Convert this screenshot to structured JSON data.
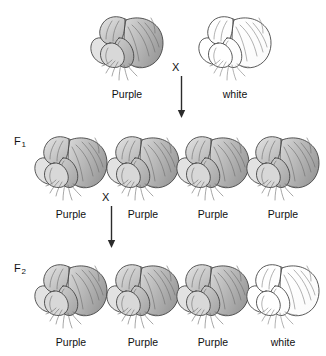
{
  "figure": {
    "background_color": "#ffffff",
    "line_color": "#3a3a3a"
  },
  "generations": [
    {
      "id": "parental",
      "label": "",
      "label_visible": false,
      "flowers": [
        {
          "phenotype_label": "Purple",
          "color_state": "purple",
          "x": 88,
          "y": 10
        },
        {
          "phenotype_label": "white",
          "color_state": "white",
          "x": 196,
          "y": 10
        }
      ]
    },
    {
      "id": "f1",
      "label": "F",
      "label_sub": "1",
      "label_visible": true,
      "label_x": 14,
      "label_y": 135,
      "flowers": [
        {
          "phenotype_label": "Purple",
          "color_state": "purple",
          "x": 32,
          "y": 130
        },
        {
          "phenotype_label": "Purple",
          "color_state": "purple",
          "x": 104,
          "y": 130
        },
        {
          "phenotype_label": "Purple",
          "color_state": "purple",
          "x": 174,
          "y": 130
        },
        {
          "phenotype_label": "Purple",
          "color_state": "purple",
          "x": 244,
          "y": 130
        }
      ]
    },
    {
      "id": "f2",
      "label": "F",
      "label_sub": "2",
      "label_visible": true,
      "label_x": 14,
      "label_y": 262,
      "flowers": [
        {
          "phenotype_label": "Purple",
          "color_state": "purple",
          "x": 32,
          "y": 258
        },
        {
          "phenotype_label": "Purple",
          "color_state": "purple",
          "x": 104,
          "y": 258
        },
        {
          "phenotype_label": "Purple",
          "color_state": "purple",
          "x": 174,
          "y": 258
        },
        {
          "phenotype_label": "white",
          "color_state": "white",
          "x": 244,
          "y": 258
        }
      ]
    }
  ],
  "crosses": [
    {
      "id": "parental-cross",
      "symbol": "X",
      "symbol_x": 172,
      "symbol_y": 62,
      "arrow_x": 177,
      "arrow_y": 76,
      "arrow_length": 42
    },
    {
      "id": "f1-cross",
      "symbol": "X",
      "symbol_x": 102,
      "symbol_y": 192,
      "arrow_x": 107,
      "arrow_y": 206,
      "arrow_length": 42
    }
  ],
  "phenotype_labels": {
    "purple": "Purple",
    "white": "white"
  },
  "ratio_note": {
    "f2_purple_count": 3,
    "f2_white_count": 1
  }
}
